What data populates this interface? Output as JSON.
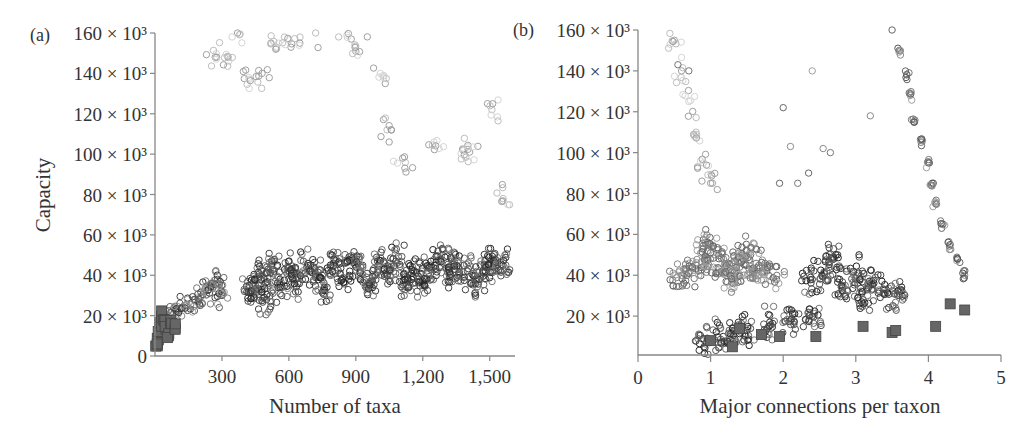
{
  "figure": {
    "panels": [
      {
        "label": "(a)",
        "xlabel": "Number of taxa",
        "ylabel": "Capacity",
        "xticks": [
          "300",
          "600",
          "900",
          "1,200",
          "1,500"
        ],
        "yticks": [
          "0",
          "20 × 10³",
          "40 × 10³",
          "60 × 10³",
          "80 × 10³",
          "100 × 10³",
          "120 × 10³",
          "140 × 10³",
          "160 × 10³"
        ]
      },
      {
        "label": "(b)",
        "xlabel": "Major connections per taxon",
        "ylabel": "",
        "xticks": [
          "0",
          "1",
          "2",
          "3",
          "4",
          "5"
        ],
        "yticks": [
          "20 × 10³",
          "40 × 10³",
          "60 × 10³",
          "80 × 10³",
          "100 × 10³",
          "120 × 10³",
          "140 × 10³",
          "160 × 10³"
        ]
      }
    ]
  },
  "chart_data": [
    {
      "type": "scatter",
      "panel": "(a)",
      "title": "",
      "xlabel": "Number of taxa",
      "ylabel": "Capacity",
      "xlim": [
        0,
        1600
      ],
      "ylim": [
        0,
        160000
      ],
      "xticks": [
        300,
        600,
        900,
        1200,
        1500
      ],
      "yticks": [
        0,
        20000,
        40000,
        60000,
        80000,
        100000,
        120000,
        140000,
        160000
      ],
      "grid": false,
      "legend": null,
      "markers": {
        "circles": "open circles, grayscale shades",
        "squares": "filled gray squares"
      },
      "series": [
        {
          "name": "dense band (dark circles)",
          "description": "Main cloud of dark open circles from ~400 to ~1,580 taxa, capacity mostly 20k-60k, centered near 40k",
          "points": [
            [
              420,
              32000
            ],
            [
              450,
              35000
            ],
            [
              480,
              40000
            ],
            [
              500,
              28000
            ],
            [
              520,
              45000
            ],
            [
              560,
              38000
            ],
            [
              600,
              42000
            ],
            [
              640,
              36000
            ],
            [
              680,
              44000
            ],
            [
              720,
              40000
            ],
            [
              760,
              33000
            ],
            [
              800,
              46000
            ],
            [
              840,
              38000
            ],
            [
              880,
              48000
            ],
            [
              920,
              42000
            ],
            [
              960,
              36000
            ],
            [
              1000,
              45000
            ],
            [
              1040,
              40000
            ],
            [
              1080,
              47000
            ],
            [
              1120,
              38000
            ],
            [
              1160,
              42000
            ],
            [
              1200,
              36000
            ],
            [
              1240,
              44000
            ],
            [
              1280,
              48000
            ],
            [
              1320,
              40000
            ],
            [
              1360,
              46000
            ],
            [
              1400,
              42000
            ],
            [
              1440,
              38000
            ],
            [
              1480,
              44000
            ],
            [
              1520,
              46000
            ],
            [
              1560,
              45000
            ]
          ]
        },
        {
          "name": "rising branch (circles)",
          "description": "Circles rising from ~50 taxa at ~20k to ~300 taxa at ~40k",
          "points": [
            [
              60,
              20000
            ],
            [
              100,
              22000
            ],
            [
              140,
              25000
            ],
            [
              180,
              28000
            ],
            [
              220,
              32000
            ],
            [
              250,
              35000
            ],
            [
              280,
              38000
            ],
            [
              300,
              30000
            ]
          ]
        },
        {
          "name": "high scatter (light circles)",
          "description": "Light/mid-gray circles spread 60k-160k capacity between ~250 and ~1,000 taxa, plus sparse outliers",
          "points": [
            [
              270,
              148000
            ],
            [
              330,
              146000
            ],
            [
              370,
              160000
            ],
            [
              420,
              138000
            ],
            [
              480,
              140000
            ],
            [
              520,
              155000
            ],
            [
              580,
              158000
            ],
            [
              650,
              158000
            ],
            [
              720,
              160000
            ],
            [
              860,
              159000
            ],
            [
              900,
              151000
            ],
            [
              1010,
              140000
            ],
            [
              1040,
              112000
            ],
            [
              1110,
              98000
            ],
            [
              1250,
              106000
            ],
            [
              1380,
              102000
            ],
            [
              1410,
              101000
            ],
            [
              1510,
              122000
            ],
            [
              1560,
              78000
            ]
          ]
        },
        {
          "name": "squares",
          "description": "Filled gray squares clustered at very low taxa counts (< ~100) with capacity 3k-22k",
          "points": [
            [
              10,
              5000
            ],
            [
              15,
              8000
            ],
            [
              20,
              12000
            ],
            [
              25,
              16000
            ],
            [
              30,
              20000
            ],
            [
              40,
              18000
            ],
            [
              50,
              14000
            ],
            [
              60,
              10000
            ],
            [
              70,
              16000
            ],
            [
              90,
              14000
            ]
          ]
        }
      ]
    },
    {
      "type": "scatter",
      "panel": "(b)",
      "title": "",
      "xlabel": "Major connections per taxon",
      "ylabel": "Capacity",
      "xlim": [
        0,
        5
      ],
      "ylim": [
        0,
        160000
      ],
      "xticks": [
        0,
        1,
        2,
        3,
        4,
        5
      ],
      "yticks": [
        20000,
        40000,
        60000,
        80000,
        100000,
        120000,
        140000,
        160000
      ],
      "grid": false,
      "legend": null,
      "series": [
        {
          "name": "mid-gray cluster",
          "description": "Dense mid-gray circles around 0.6-2.0 connections, capacity 35k-60k",
          "points": [
            [
              0.6,
              40000
            ],
            [
              0.8,
              45000
            ],
            [
              1.0,
              48000
            ],
            [
              1.2,
              44000
            ],
            [
              1.4,
              46000
            ],
            [
              1.6,
              42000
            ],
            [
              1.8,
              40000
            ],
            [
              1.0,
              55000
            ],
            [
              1.3,
              38000
            ],
            [
              1.5,
              52000
            ]
          ]
        },
        {
          "name": "dark cluster",
          "description": "Dense dark circles around 2.3-3.8 connections, capacity 25k-55k",
          "points": [
            [
              2.4,
              38000
            ],
            [
              2.6,
              42000
            ],
            [
              2.8,
              35000
            ],
            [
              3.0,
              40000
            ],
            [
              3.2,
              36000
            ],
            [
              3.4,
              33000
            ],
            [
              3.6,
              30000
            ],
            [
              2.7,
              48000
            ],
            [
              3.1,
              28000
            ]
          ]
        },
        {
          "name": "steep diagonal band",
          "description": "Circles forming a steep band from (3.5,160k) down to (4.5,40k)",
          "points": [
            [
              3.5,
              160000
            ],
            [
              3.6,
              150000
            ],
            [
              3.7,
              138000
            ],
            [
              3.75,
              128000
            ],
            [
              3.8,
              115000
            ],
            [
              3.9,
              105000
            ],
            [
              4.0,
              95000
            ],
            [
              4.05,
              85000
            ],
            [
              4.1,
              75000
            ],
            [
              4.2,
              65000
            ],
            [
              4.3,
              55000
            ],
            [
              4.4,
              48000
            ],
            [
              4.5,
              40000
            ]
          ]
        },
        {
          "name": "lower dark branch",
          "description": "Dark circles along bottom from ~0.9 to ~2.5 connections at 8k-20k",
          "points": [
            [
              0.9,
              9000
            ],
            [
              1.1,
              10000
            ],
            [
              1.3,
              11000
            ],
            [
              1.5,
              13000
            ],
            [
              1.8,
              15000
            ],
            [
              2.1,
              18000
            ],
            [
              2.4,
              20000
            ]
          ]
        },
        {
          "name": "light upper-left",
          "description": "Very light (faint) circles at 0.3-1.0 connections spanning 80k-160k",
          "points": [
            [
              0.5,
              155000
            ],
            [
              0.6,
              140000
            ],
            [
              0.7,
              125000
            ],
            [
              0.8,
              110000
            ],
            [
              0.9,
              95000
            ],
            [
              1.0,
              85000
            ]
          ]
        },
        {
          "name": "squares",
          "description": "Filled gray squares near bottom",
          "points": [
            [
              1.0,
              8000
            ],
            [
              1.3,
              5000
            ],
            [
              1.4,
              14000
            ],
            [
              1.7,
              11000
            ],
            [
              1.95,
              10000
            ],
            [
              2.45,
              10000
            ],
            [
              3.1,
              15000
            ],
            [
              3.5,
              12000
            ],
            [
              3.55,
              13000
            ],
            [
              4.1,
              15000
            ],
            [
              4.3,
              26000
            ],
            [
              4.5,
              23000
            ]
          ]
        },
        {
          "name": "outliers",
          "points": [
            [
              0.55,
              143000
            ],
            [
              0.7,
              140000
            ],
            [
              2.4,
              140000
            ],
            [
              2.0,
              122000
            ],
            [
              3.2,
              118000
            ],
            [
              2.1,
              103000
            ],
            [
              2.55,
              102000
            ],
            [
              2.65,
              100000
            ],
            [
              2.35,
              90000
            ],
            [
              1.95,
              85000
            ],
            [
              2.2,
              85000
            ]
          ]
        }
      ]
    }
  ]
}
